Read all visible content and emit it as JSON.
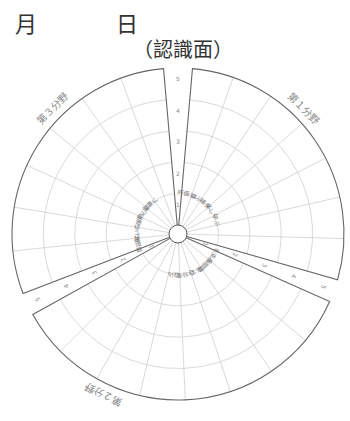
{
  "header": {
    "month_label": "月",
    "day_label": "日",
    "subtitle": "（認識面）"
  },
  "diagram": {
    "center": [
      178,
      234
    ],
    "outer_radius": 166,
    "hub_radius": 9,
    "rings": 5,
    "scale_labels": [
      "1",
      "2",
      "3",
      "4",
      "5"
    ],
    "sections": [
      {
        "name": "第１分野",
        "start_deg": -85,
        "end_deg": 16,
        "wedges": [
          "評価し",
          "尊ぶ",
          "補う",
          "楽しく",
          "学ぶ",
          "",
          ""
        ],
        "label_angle": -45
      },
      {
        "name": "第２分野",
        "start_deg": 24,
        "end_deg": 151,
        "wedges": [
          "を支援",
          "人間関",
          "来て",
          "自分を",
          "取込",
          "",
          "",
          ""
        ],
        "label_angle": 115
      },
      {
        "name": "第３分野",
        "start_deg": 159,
        "end_deg": 265,
        "wedges": [
          "意図に",
          "解いて",
          "心理的",
          "安心に",
          "健康に",
          "",
          ""
        ],
        "label_angle": -135
      }
    ],
    "gaps": [
      {
        "position": "top",
        "center_deg": -90
      },
      {
        "position": "lower-right",
        "center_deg": 20
      },
      {
        "position": "lower-left",
        "center_deg": 155
      }
    ],
    "colors": {
      "outline": "#666666",
      "grid": "#c8c8c8",
      "text": "#888888"
    }
  }
}
